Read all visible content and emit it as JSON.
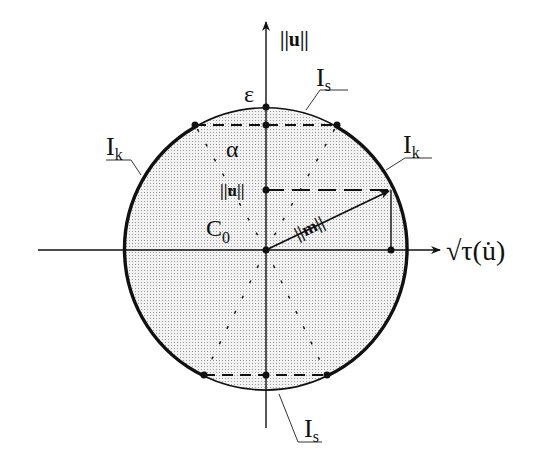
{
  "diagram": {
    "axes": {
      "vertical_label": "||u||",
      "horizontal_label": "√τ(u̇)"
    },
    "labels": {
      "epsilon": "ε",
      "alpha": "α",
      "u_norm": "||u||",
      "c0": "C",
      "c0_sub": "0",
      "m_norm": "||m||",
      "is_top": "I",
      "is_top_sub": "s",
      "is_bottom": "I",
      "is_bottom_sub": "s",
      "ik_left": "I",
      "ik_left_sub": "k",
      "ik_right": "I",
      "ik_right_sub": "k"
    },
    "colors": {
      "ink": "#111111",
      "fill": "#e6e6e6",
      "background": "#ffffff"
    }
  }
}
